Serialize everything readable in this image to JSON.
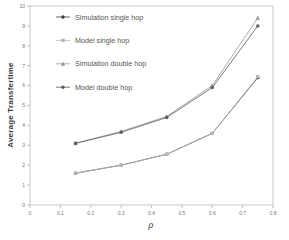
{
  "chart_data": {
    "type": "line",
    "title": "",
    "xlabel": "ρ",
    "ylabel": "Average Transfertime",
    "xlim": [
      0,
      0.8
    ],
    "ylim": [
      0,
      10
    ],
    "xticks": [
      0,
      0.1,
      0.2,
      0.3,
      0.4,
      0.5,
      0.6,
      0.7,
      0.8
    ],
    "yticks": [
      0,
      1,
      2,
      3,
      4,
      5,
      6,
      7,
      8,
      9,
      10
    ],
    "grid": false,
    "legend_position": "top-left-inside",
    "x": [
      0.15,
      0.3,
      0.45,
      0.6,
      0.75
    ],
    "series": [
      {
        "name": "Simulation single hop",
        "marker": "circle",
        "color": "#3a3a3a",
        "values": [
          1.6,
          2.0,
          2.55,
          3.6,
          6.4
        ]
      },
      {
        "name": "Model single hop",
        "marker": "square",
        "color": "#b8b8b8",
        "values": [
          1.6,
          2.0,
          2.55,
          3.6,
          6.45
        ]
      },
      {
        "name": "Simulation double hop",
        "marker": "triangle",
        "color": "#979797",
        "values": [
          3.1,
          3.7,
          4.45,
          6.0,
          9.4
        ]
      },
      {
        "name": "Model double hop",
        "marker": "circle",
        "color": "#5a5a5a",
        "values": [
          3.1,
          3.65,
          4.4,
          5.9,
          9.0
        ]
      }
    ],
    "colors": {
      "frame": "#b3b3b3",
      "tick": "#999999",
      "tick_label": "#777777",
      "legend_text": "#565656"
    }
  }
}
